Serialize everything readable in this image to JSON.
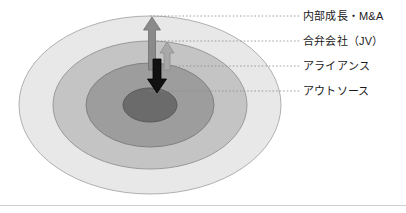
{
  "diagram": {
    "type": "concentric-ellipse-onion",
    "title_visible": false,
    "background_color": "#ffffff",
    "rings": [
      {
        "id": "ring-outer",
        "label": "内部成長・M&A",
        "level": 4,
        "fill": "#e8e8e8",
        "stroke": "#b0b0b0",
        "cx": 150,
        "cy": 105,
        "rx": 131,
        "ry": 89,
        "leader_y": 16
      },
      {
        "id": "ring-second",
        "label": "合弁会社（JV）",
        "level": 3,
        "fill": "#c4c4c4",
        "stroke": "#9a9a9a",
        "cx": 150,
        "cy": 105,
        "rx": 97,
        "ry": 64,
        "leader_y": 41
      },
      {
        "id": "ring-third",
        "label": "アライアンス",
        "level": 2,
        "fill": "#9d9d9d",
        "stroke": "#808080",
        "cx": 150,
        "cy": 105,
        "rx": 64,
        "ry": 42,
        "leader_y": 66
      },
      {
        "id": "ring-core",
        "label": "アウトソース",
        "level": 1,
        "fill": "#6b6b6b",
        "stroke": "#5a5a5a",
        "cx": 150,
        "cy": 105,
        "rx": 27,
        "ry": 17,
        "leader_y": 91
      }
    ],
    "arrows": [
      {
        "id": "arrow-outward-long",
        "direction": "up",
        "color": "#8a8a8a",
        "stroke": "#6e6e6e",
        "x": 152,
        "tip_y": 17,
        "tail_y": 70,
        "shaft_width": 7,
        "head_width": 17,
        "head_height": 13,
        "meaning": "expansion to outer ring"
      },
      {
        "id": "arrow-outward-short",
        "direction": "up",
        "color": "#a8a8a8",
        "stroke": "#8d8d8d",
        "x": 167,
        "tip_y": 42,
        "tail_y": 70,
        "shaft_width": 6,
        "head_width": 14,
        "head_height": 11,
        "meaning": "expansion to second ring"
      },
      {
        "id": "arrow-inward-black",
        "direction": "down",
        "color": "#111111",
        "stroke": "#000000",
        "x": 157,
        "tip_y": 93,
        "tail_y": 59,
        "shaft_width": 8,
        "head_width": 19,
        "head_height": 14,
        "meaning": "contraction to core"
      }
    ],
    "leader_lines": {
      "style": "dotted",
      "color": "#8c8c8c",
      "x_end": 300
    },
    "footer_rule": {
      "visible": true,
      "color": "#cfcfcf",
      "y": 205
    }
  }
}
